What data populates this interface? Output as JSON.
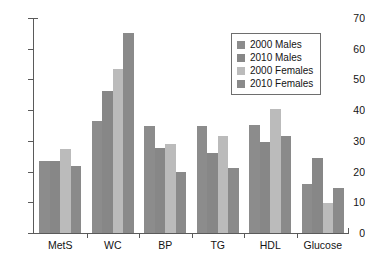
{
  "chart_data": {
    "type": "bar",
    "title": "",
    "subtitle": "",
    "xlabel": "",
    "ylabel": "",
    "ylim": [
      0,
      70
    ],
    "ytick_values": [
      0,
      10,
      20,
      30,
      40,
      50,
      60,
      70
    ],
    "ytick_labels": [
      "0",
      "10",
      "20",
      "30",
      "40",
      "50",
      "60",
      "70"
    ],
    "grid": false,
    "legend_position": "top-right",
    "categories": [
      "MetS",
      "WC",
      "BP",
      "TG",
      "HDL",
      "Glucose"
    ],
    "series": [
      {
        "name": "2000 Males",
        "color": "#8c8c8c",
        "values": [
          23.4,
          36.4,
          34.9,
          34.7,
          35.3,
          16.0
        ]
      },
      {
        "name": "2010 Males",
        "color": "#878787",
        "values": [
          23.5,
          46.2,
          27.7,
          26.0,
          29.5,
          24.5
        ]
      },
      {
        "name": "2000 Females",
        "color": "#bbbbbb",
        "values": [
          27.4,
          53.4,
          29.1,
          31.7,
          40.5,
          9.7
        ]
      },
      {
        "name": "2010 Females",
        "color": "#8a8a8a",
        "values": [
          21.7,
          65.1,
          20.0,
          21.3,
          31.5,
          14.7
        ]
      }
    ]
  },
  "axis": {
    "line_color": "#5a5a5a"
  },
  "legend": {
    "border_color": "#6e6e6e",
    "background": "#ffffff"
  },
  "icons": {
    "legend_swatch": "square-swatch-icon"
  }
}
